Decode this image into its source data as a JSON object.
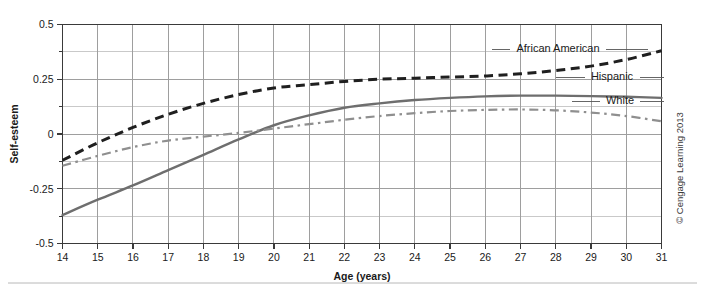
{
  "figure": {
    "copyright": "© Cengage Learning 2013"
  },
  "chart_data": {
    "type": "line",
    "title": "",
    "xlabel": "Age (years)",
    "ylabel": "Self-esteem",
    "xlim": [
      14,
      31
    ],
    "ylim": [
      -0.5,
      0.5
    ],
    "grid": true,
    "legend_position": "inline-right-leader-lines",
    "x_ticks": [
      14,
      15,
      16,
      17,
      18,
      19,
      20,
      21,
      22,
      23,
      24,
      25,
      26,
      27,
      28,
      29,
      30,
      31
    ],
    "x_tick_labels": [
      "14",
      "15",
      "16",
      "17",
      "18",
      "19",
      "20",
      "21",
      "22",
      "23",
      "24",
      "25",
      "26",
      "27",
      "28",
      "29",
      "30",
      "31"
    ],
    "y_ticks": [
      -0.5,
      -0.25,
      0,
      0.25,
      0.5
    ],
    "y_tick_labels": [
      "-0.5",
      "-0.25",
      "0",
      "0.25",
      "0.5"
    ],
    "y_minor_ticks": [
      -0.375,
      -0.125,
      0.125,
      0.375
    ],
    "x": [
      14,
      15,
      16,
      17,
      18,
      19,
      20,
      21,
      22,
      23,
      24,
      25,
      26,
      27,
      28,
      29,
      30,
      31
    ],
    "series": [
      {
        "name": "African American",
        "color": "#1f1f1f",
        "style": "dashed",
        "values": [
          -0.12,
          -0.04,
          0.03,
          0.09,
          0.14,
          0.18,
          0.21,
          0.225,
          0.24,
          0.25,
          0.255,
          0.26,
          0.265,
          0.275,
          0.29,
          0.31,
          0.34,
          0.38
        ]
      },
      {
        "name": "Hispanic",
        "color": "#6e6e6e",
        "style": "solid",
        "values": [
          -0.37,
          -0.3,
          -0.235,
          -0.165,
          -0.095,
          -0.025,
          0.04,
          0.085,
          0.12,
          0.14,
          0.155,
          0.165,
          0.172,
          0.175,
          0.175,
          0.173,
          0.17,
          0.165
        ]
      },
      {
        "name": "White",
        "color": "#8f8f8f",
        "style": "dashdot",
        "values": [
          -0.145,
          -0.1,
          -0.06,
          -0.03,
          -0.012,
          0.005,
          0.025,
          0.045,
          0.065,
          0.082,
          0.095,
          0.105,
          0.11,
          0.112,
          0.108,
          0.098,
          0.082,
          0.058
        ]
      }
    ]
  }
}
